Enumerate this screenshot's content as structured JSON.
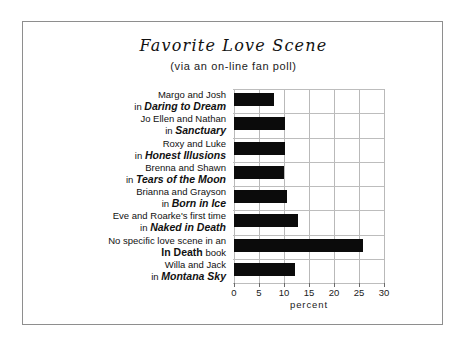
{
  "chart_data": {
    "type": "bar",
    "orientation": "horizontal",
    "title": "Favorite Love Scene",
    "subtitle": "(via an on-line fan poll)",
    "xlabel": "percent",
    "ylabel": "",
    "xlim": [
      0,
      30
    ],
    "xticks": [
      0,
      5,
      10,
      15,
      20,
      25,
      30
    ],
    "grid": true,
    "legend": false,
    "bar_color": "#0b0b0b",
    "categories": [
      "Margo and Josh in Daring to Dream",
      "Jo Ellen and Nathan in Sanctuary",
      "Roxy and Luke in Honest Illusions",
      "Brenna and Shawn in Tears of the Moon",
      "Brianna and Grayson in Born in Ice",
      "Eve and Roarke's first time in Naked in Death",
      "No specific love scene in an In Death book",
      "Willa and Jack in Montana Sky"
    ],
    "values": [
      8,
      10.2,
      10.2,
      10,
      10.6,
      12.8,
      25.8,
      12.2
    ],
    "items": [
      {
        "line1": "Margo and Josh",
        "prefix": "in ",
        "work": "Daring to Dream",
        "work_style": "bold-italic",
        "suffix": "",
        "value": 8
      },
      {
        "line1": "Jo Ellen and Nathan",
        "prefix": "in ",
        "work": "Sanctuary",
        "work_style": "bold-italic",
        "suffix": "",
        "value": 10.2
      },
      {
        "line1": "Roxy and Luke",
        "prefix": "in ",
        "work": "Honest Illusions",
        "work_style": "bold-italic",
        "suffix": "",
        "value": 10.2
      },
      {
        "line1": "Brenna and Shawn",
        "prefix": "in ",
        "work": "Tears of the Moon",
        "work_style": "bold-italic",
        "suffix": "",
        "value": 10
      },
      {
        "line1": "Brianna and Grayson",
        "prefix": "in ",
        "work": "Born in Ice",
        "work_style": "bold-italic",
        "suffix": "",
        "value": 10.6
      },
      {
        "line1": "Eve and Roarke's first time",
        "prefix": "in ",
        "work": "Naked in Death",
        "work_style": "bold-italic",
        "suffix": "",
        "value": 12.8
      },
      {
        "line1": "No specific love scene in an",
        "prefix": "",
        "work": "In Death",
        "work_style": "bold",
        "suffix": " book",
        "value": 25.8
      },
      {
        "line1": "Willa and Jack",
        "prefix": "in ",
        "work": "Montana Sky",
        "work_style": "bold-italic",
        "suffix": "",
        "value": 12.2
      }
    ]
  }
}
